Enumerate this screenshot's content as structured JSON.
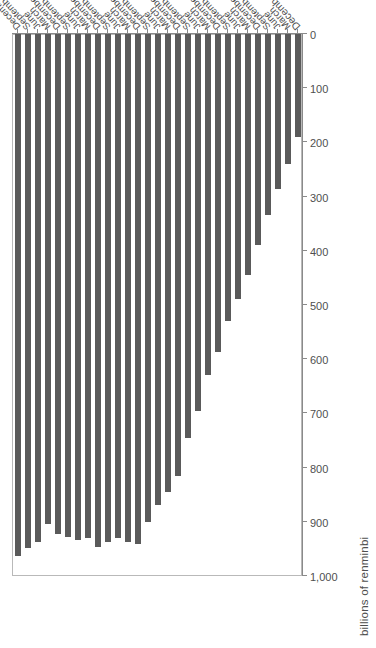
{
  "chart_data": {
    "type": "bar",
    "orientation": "horizontal-rotated",
    "title": "",
    "xlabel": "",
    "ylabel": "billions of renminbi",
    "axis_title": "billions of renminbi",
    "value_axis": {
      "min": 0,
      "max": 1000,
      "tick_step": 100,
      "ticks": [
        1000,
        900,
        800,
        700,
        600,
        500,
        400,
        300,
        200,
        100,
        0
      ],
      "tick_labels": [
        "1,000",
        "900",
        "800",
        "700",
        "600",
        "500",
        "400",
        "300",
        "200",
        "100",
        "0"
      ],
      "direction": "decreasing-left-to-right"
    },
    "grid": false,
    "legend": null,
    "bar_color": "#5a5a5a",
    "categories": [
      "December 2010",
      "March",
      "June",
      "September",
      "December",
      "March",
      "June",
      "September",
      "December",
      "March",
      "June",
      "September",
      "December",
      "March",
      "June",
      "September",
      "December",
      "March",
      "June",
      "September",
      "December",
      "March",
      "June",
      "September",
      "December",
      "March",
      "June",
      "September",
      "December"
    ],
    "values": [
      192,
      242,
      287,
      335,
      392,
      447,
      490,
      532,
      589,
      631,
      698,
      748,
      818,
      846,
      871,
      902,
      942,
      940,
      932,
      939,
      948,
      931,
      936,
      930,
      924,
      906,
      940,
      950,
      965
    ],
    "year_groups": [
      {
        "label": "2011",
        "start_index": 1,
        "end_index": 4
      },
      {
        "label": "2012",
        "start_index": 5,
        "end_index": 8
      },
      {
        "label": "2013",
        "start_index": 9,
        "end_index": 12
      },
      {
        "label": "2014",
        "start_index": 13,
        "end_index": 16
      },
      {
        "label": "2015",
        "start_index": 17,
        "end_index": 20
      },
      {
        "label": "2016",
        "start_index": 21,
        "end_index": 24
      },
      {
        "label": "2017",
        "start_index": 25,
        "end_index": 28
      }
    ]
  }
}
